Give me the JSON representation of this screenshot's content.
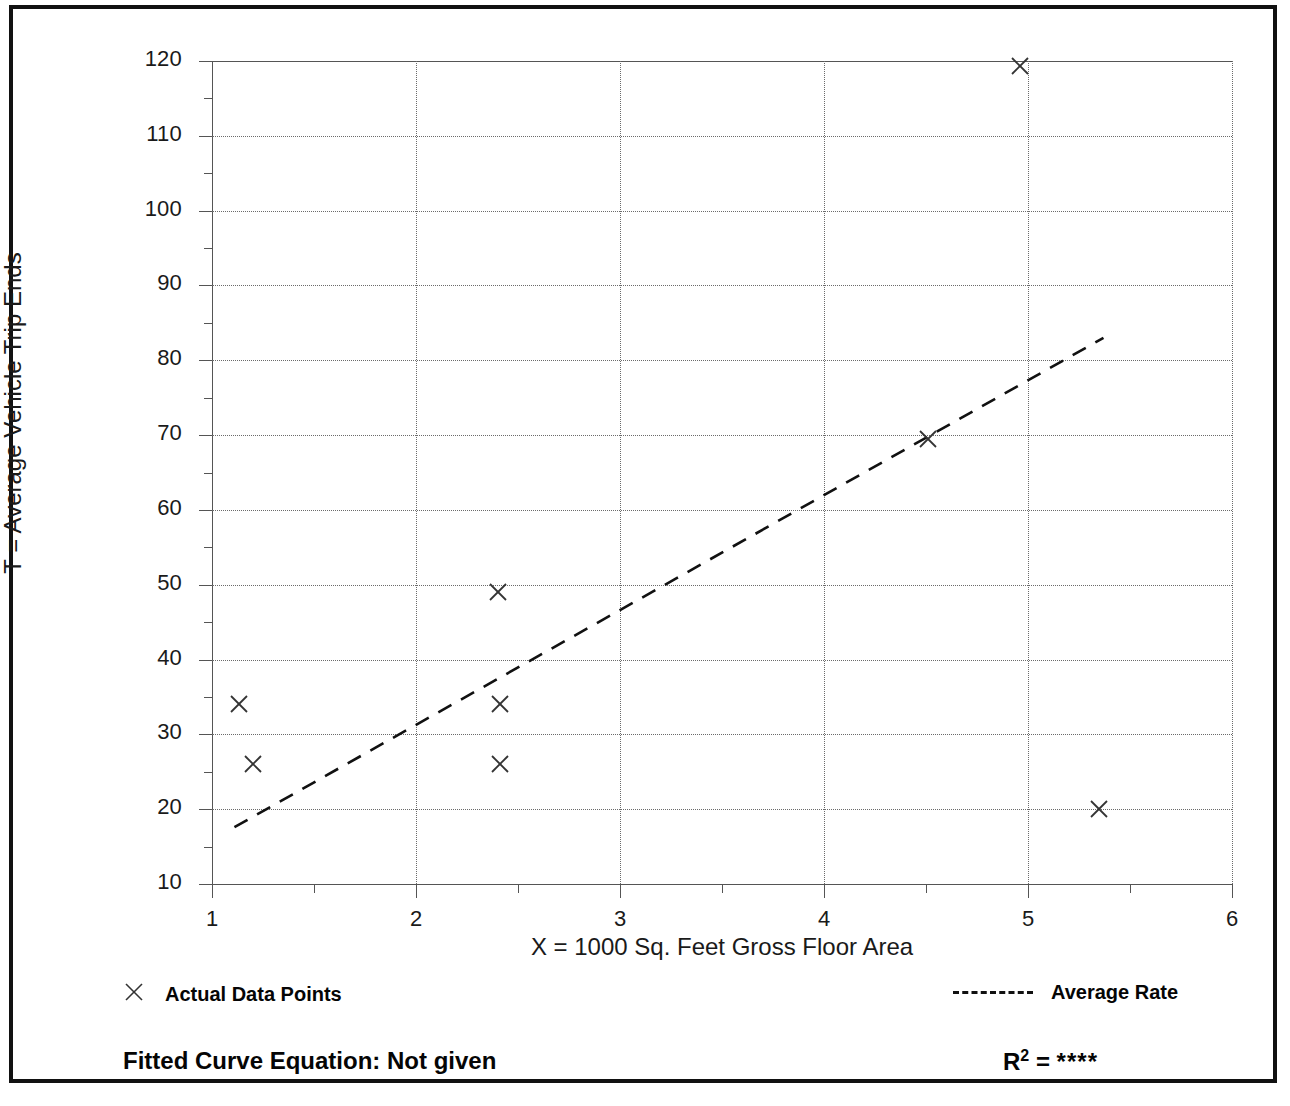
{
  "figure": {
    "background_color": "#ffffff",
    "frame_color": "#111111",
    "marker_color": "#333333",
    "grid_color": "#6b6b6b",
    "axis_color": "#555555"
  },
  "legend": {
    "data_points_label": "Actual Data Points",
    "data_points_marker": "x-cross-marker",
    "average_rate_label": "Average Rate",
    "average_rate_marker": "dashed-line-sample"
  },
  "footer": {
    "fitted_equation": "Fitted Curve Equation:  Not given",
    "r_squared_symbol": "R",
    "r_squared_exponent": "2",
    "r_squared_equals": " = ",
    "r_squared_value": "****"
  },
  "chart_data": {
    "type": "scatter",
    "title": "",
    "xlabel": "X = 1000 Sq. Feet Gross Floor Area",
    "ylabel": "T = Average Vehicle Trip Ends",
    "xlim": [
      1,
      6
    ],
    "ylim": [
      10,
      120
    ],
    "grid": true,
    "legend_position": "below-axes",
    "x_ticks": [
      1,
      2,
      3,
      4,
      5,
      6
    ],
    "x_tick_labels": [
      "1",
      "2",
      "3",
      "4",
      "5",
      "6"
    ],
    "x_minor_ticks": [
      1.5,
      2.5,
      3.5,
      4.5,
      5.5
    ],
    "y_ticks": [
      10,
      20,
      30,
      40,
      50,
      60,
      70,
      80,
      90,
      100,
      110,
      120
    ],
    "y_tick_labels": [
      "10",
      "20",
      "30",
      "40",
      "50",
      "60",
      "70",
      "80",
      "90",
      "100",
      "110",
      "120"
    ],
    "y_minor_ticks": [
      15,
      25,
      35,
      45,
      55,
      65,
      75,
      85,
      95,
      105,
      115
    ],
    "series": [
      {
        "name": "Actual Data Points",
        "type": "scatter",
        "marker": "x",
        "points": [
          {
            "x": 1.13,
            "y": 34
          },
          {
            "x": 1.2,
            "y": 26
          },
          {
            "x": 2.4,
            "y": 49
          },
          {
            "x": 2.41,
            "y": 34
          },
          {
            "x": 2.41,
            "y": 26
          },
          {
            "x": 4.51,
            "y": 69.5
          },
          {
            "x": 4.96,
            "y": 119.3
          },
          {
            "x": 5.35,
            "y": 20
          }
        ]
      },
      {
        "name": "Average Rate",
        "type": "line",
        "style": "dashed",
        "endpoints": [
          {
            "x": 1.11,
            "y": 17.6
          },
          {
            "x": 5.37,
            "y": 83.0
          }
        ]
      }
    ]
  }
}
